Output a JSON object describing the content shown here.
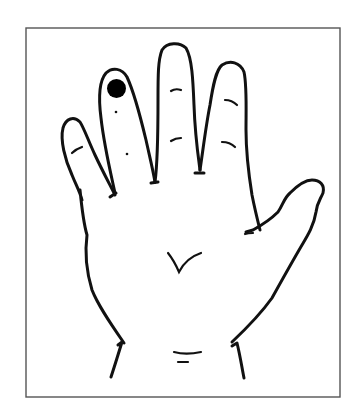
{
  "figure": {
    "title": "Hand diagram with marked point on fingertip",
    "marker": {
      "label": "marked point",
      "location": "tip of finger second from left",
      "color": "#000000"
    },
    "colors": {
      "background": "#ffffff",
      "line": "#111111",
      "frame": "#555555"
    }
  }
}
